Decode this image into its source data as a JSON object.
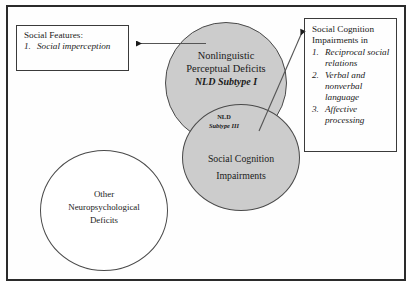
{
  "figure": {
    "frame_color": "#2b2b2b",
    "shaded_fill": "#cccccc",
    "unshaded_fill": "#ffffff"
  },
  "social_features_box": {
    "heading": "Social Features:",
    "items": [
      {
        "num": "1.",
        "text": "Social imperception"
      }
    ]
  },
  "social_cognition_box": {
    "heading_line1": "Social Cognition",
    "heading_line2": "Impairments in",
    "items": [
      {
        "num": "1.",
        "text": "Reciprocal social relations"
      },
      {
        "num": "2.",
        "text": "Verbal and nonverbal language"
      },
      {
        "num": "3.",
        "text": "Affective processing"
      }
    ]
  },
  "circles": {
    "nonlinguistic": {
      "line1": "Nonlinguistic",
      "line2": "Perceptual Deficits",
      "subtype": "NLD Subtype I"
    },
    "social_cognition": {
      "line1": "Social Cognition",
      "line2": "Impairments"
    },
    "other_neuro": {
      "line1": "Other",
      "line2": "Neuropsychological",
      "line3": "Deficits"
    },
    "intersection": {
      "line1": "NLD",
      "line2": "Subtype III"
    }
  },
  "connectors": {
    "left_arrow": "arrow pointing left from nonlinguistic circle to Social Features box",
    "right_arrow": "arrow pointing up-right from overlap region to Social Cognition Impairments box"
  }
}
